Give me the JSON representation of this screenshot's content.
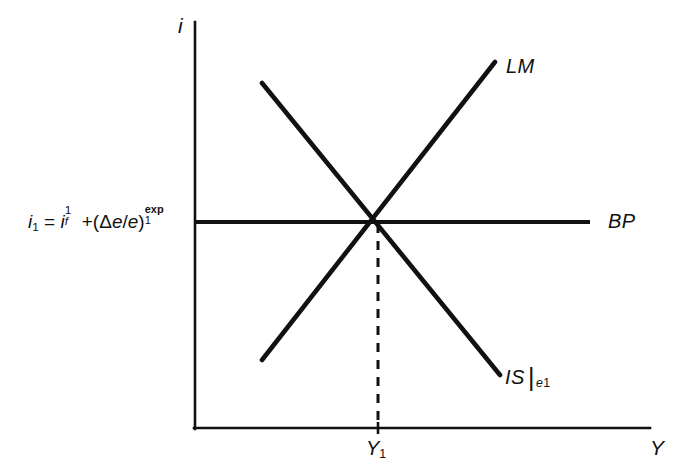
{
  "figure": {
    "background_color": "#ffffff",
    "line_color": "#111111"
  },
  "axes": {
    "y_axis_label": "i",
    "x_axis_label": "Y",
    "origin": {
      "x": 195,
      "y": 428
    },
    "y_axis_top": 22,
    "x_axis_right": 650
  },
  "equilibrium": {
    "tick_label": "Y",
    "tick_label_sub": "1",
    "x": 378,
    "y": 222
  },
  "interest_rate_expression": {
    "lhs_symbol": "i",
    "lhs_sub": "1",
    "equals": "=",
    "foreign_symbol": "i",
    "foreign_sup": "1",
    "foreign_sub": "f",
    "plus": "+(",
    "delta": "Δ",
    "e_numer": "e",
    "slash": "/",
    "e_denom": "e",
    "close_paren": ")",
    "exp_sup": "exp",
    "exp_sub": "1",
    "full_text": "i1 = if1 +(Δe/e)1exp"
  },
  "curves": [
    {
      "name": "LM",
      "label": "LM",
      "label_x": 506,
      "label_y": 56,
      "x1": 262,
      "y1": 360,
      "x2": 495,
      "y2": 62,
      "slope": "upward"
    },
    {
      "name": "IS",
      "label": "IS",
      "label_sub": "e",
      "label_sub2": "1",
      "label_x": 505,
      "label_y": 363,
      "x1": 262,
      "y1": 83,
      "x2": 500,
      "y2": 375,
      "slope": "downward"
    },
    {
      "name": "BP",
      "label": "BP",
      "label_x": 608,
      "label_y": 211,
      "x1": 195,
      "y1": 222,
      "x2": 590,
      "y2": 222,
      "slope": "horizontal"
    }
  ],
  "guide_line": {
    "name": "equilibrium-dashed-line",
    "style": "dashed",
    "x": 378,
    "y_top": 222,
    "y_bottom": 428
  }
}
